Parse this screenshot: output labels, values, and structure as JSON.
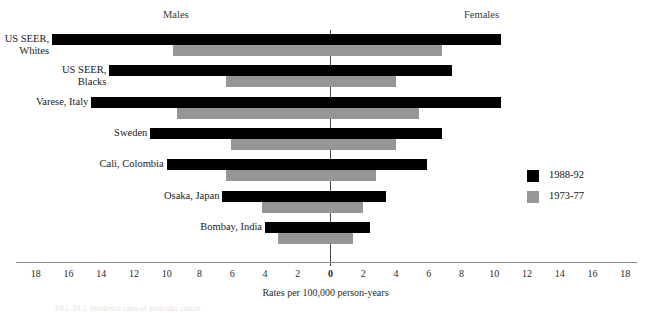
{
  "headers": {
    "left": "Males",
    "right": "Females"
  },
  "axis": {
    "title": "Rates per 100,000 person-years",
    "ticks": [
      "18",
      "16",
      "14",
      "12",
      "10",
      "8",
      "6",
      "4",
      "2",
      "0",
      "2",
      "4",
      "6",
      "8",
      "10",
      "12",
      "14",
      "16",
      "18"
    ]
  },
  "legend": {
    "position": "right",
    "entries": [
      {
        "label": "1988-92",
        "color": "#000000",
        "swatch": "legend-swatch-black"
      },
      {
        "label": "1973-77",
        "color": "#969696",
        "swatch": "legend-swatch-gray"
      }
    ]
  },
  "caption": "FIG. 10.3. Incidence rates of testicular cancer",
  "chart_data": {
    "type": "bar",
    "orientation": "horizontal-diverging",
    "title": "",
    "subtitle": "",
    "xlabel": "Rates per 100,000 person-years",
    "ylabel": "",
    "xlim": [
      -18,
      18
    ],
    "xtick_step": 2,
    "grid": false,
    "left_side": "Males",
    "right_side": "Females",
    "categories": [
      "US SEER,\nWhites",
      "US SEER,\nBlacks",
      "Varese, Italy",
      "Sweden",
      "Cali, Colombia",
      "Osaka, Japan",
      "Bombay, India"
    ],
    "series": [
      {
        "name": "1988-92",
        "color": "#000000",
        "males": [
          17.0,
          13.5,
          14.6,
          11.0,
          10.0,
          6.6,
          4.0
        ],
        "females": [
          10.4,
          7.4,
          10.4,
          6.8,
          5.9,
          3.4,
          2.4
        ]
      },
      {
        "name": "1973-77",
        "color": "#969696",
        "males": [
          9.6,
          6.4,
          9.4,
          6.1,
          6.4,
          4.2,
          3.2
        ],
        "females": [
          6.8,
          4.0,
          5.4,
          4.0,
          2.8,
          2.0,
          1.4
        ]
      }
    ]
  }
}
